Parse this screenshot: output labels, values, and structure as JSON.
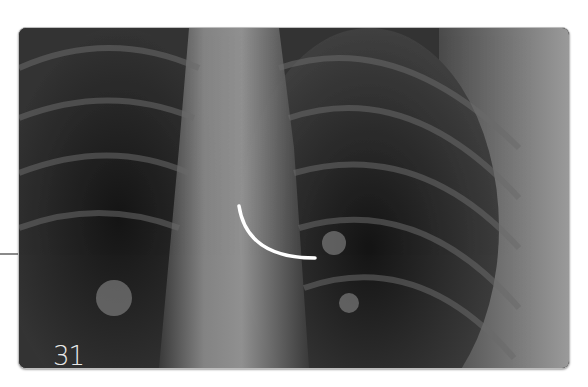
{
  "figure": {
    "number_label": "31",
    "colors": {
      "marker": "#ffffff",
      "leader_line": "#8a8a8a"
    }
  }
}
